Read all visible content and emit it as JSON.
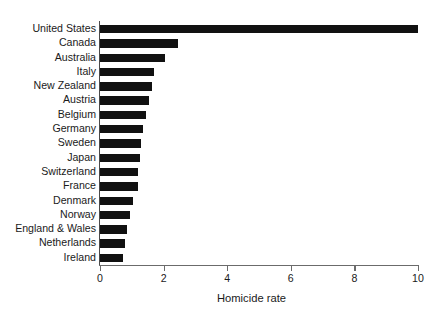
{
  "chart_data": {
    "type": "bar",
    "orientation": "horizontal",
    "title": "",
    "xlabel": "Homicide rate",
    "ylabel": "",
    "xlim": [
      0,
      10
    ],
    "xticks": [
      0,
      2,
      4,
      6,
      8,
      10
    ],
    "xtick_labels": [
      "0",
      "2",
      "4",
      "6",
      "8",
      "10"
    ],
    "grid": false,
    "legend": false,
    "categories": [
      "United States",
      "Canada",
      "Australia",
      "Italy",
      "New Zealand",
      "Austria",
      "Belgium",
      "Germany",
      "Sweden",
      "Japan",
      "Switzerland",
      "France",
      "Denmark",
      "Norway",
      "England & Wales",
      "Netherlands",
      "Ireland"
    ],
    "values": [
      10.0,
      2.45,
      2.05,
      1.7,
      1.65,
      1.55,
      1.45,
      1.35,
      1.3,
      1.25,
      1.2,
      1.2,
      1.05,
      0.95,
      0.85,
      0.8,
      0.72
    ],
    "bar_color": "#111111",
    "axis_color": "#6b6b6b",
    "background_color": "#ffffff"
  }
}
